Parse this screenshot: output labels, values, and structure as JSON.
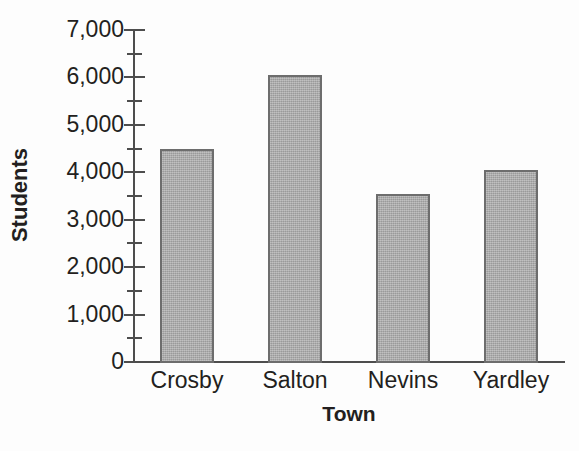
{
  "chart_data": {
    "type": "bar",
    "title": "",
    "xlabel": "Town",
    "ylabel": "Students",
    "categories": [
      "Crosby",
      "Salton",
      "Nevins",
      "Yardley"
    ],
    "values": [
      4500,
      6050,
      3550,
      4050
    ],
    "ylim": [
      0,
      7000
    ],
    "y_major_ticks": [
      0,
      1000,
      2000,
      3000,
      4000,
      5000,
      6000,
      7000
    ],
    "y_minor_ticks": [
      500,
      1500,
      2500,
      3500,
      4500,
      5500,
      6500
    ],
    "y_tick_labels": [
      "0",
      "1,000",
      "2,000",
      "3,000",
      "4,000",
      "5,000",
      "6,000",
      "7,000"
    ],
    "grid": false,
    "legend": false,
    "series": [
      {
        "name": "Students",
        "values": [
          4500,
          6050,
          3550,
          4050
        ]
      }
    ],
    "bar_fill_color": "#a9a9a9",
    "bar_border_color": "#6d6d6d",
    "axis_color": "#4d4d4d",
    "text_color": "#231f20",
    "background_color": "#fdfdfd"
  }
}
